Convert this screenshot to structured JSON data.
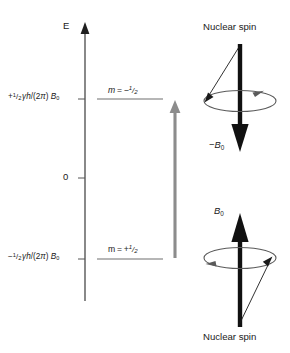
{
  "figure": {
    "background_color": "#ffffff",
    "axis_color": "#3a3a3a",
    "level_color": "#6e6e6e",
    "transition_arrow_color": "#8c8c8c",
    "spin_arrow_color": "#111111",
    "ellipse_color": "#5a5a5a"
  },
  "axis": {
    "label": "E",
    "zero_label": "0"
  },
  "levels": [
    {
      "id": "upper",
      "energy_label_prefix": "+",
      "energy_label": "+1/2 γh/(2π) B0",
      "state_label": "m = −1/2",
      "state_m_symbol": "m",
      "state_sign": "−"
    },
    {
      "id": "lower",
      "energy_label_prefix": "−",
      "energy_label": "−1/2 γh/(2π) B0",
      "state_label": "m = +1/2",
      "state_m_symbol": "m",
      "state_sign": "+"
    }
  ],
  "transition": {
    "name": "absorption-arrow",
    "direction": "up",
    "color": "#8c8c8c"
  },
  "spin_diagrams": [
    {
      "id": "antiparallel",
      "position": "top-right",
      "top_caption": "Nuclear spin",
      "field_label": "−B0",
      "field_symbol": "B",
      "field_sign": "−",
      "field_subscript": "0",
      "arrow_direction": "down",
      "precession": "counterclockwise"
    },
    {
      "id": "parallel",
      "position": "bottom-right",
      "bottom_caption": "Nuclear spin",
      "field_label": "B0",
      "field_symbol": "B",
      "field_sign": "",
      "field_subscript": "0",
      "arrow_direction": "up",
      "precession": "clockwise"
    }
  ],
  "symbols": {
    "gamma": "γ",
    "planck": "h",
    "pi": "π",
    "half_num": "1",
    "half_den": "2",
    "slash": "/",
    "B": "B",
    "zero_sub": "0",
    "equals": "=",
    "plus": "+",
    "minus": "−",
    "two_pi_open": "/(2",
    "two_pi_close": ")"
  }
}
